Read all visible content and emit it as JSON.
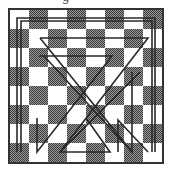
{
  "caption": {
    "visible_text": "g"
  },
  "board": {
    "rows": 8,
    "cols": 8,
    "origin": [
      10,
      10
    ],
    "size": 152,
    "first_square": "light",
    "colors": {
      "light": "#ffffff",
      "dark": "#6e6e6e",
      "border": "#333333",
      "line": "#2a2a2a"
    }
  },
  "tour_lines": [
    [
      [
        21,
        152
      ],
      [
        21,
        21
      ],
      [
        152,
        21
      ],
      [
        152,
        152
      ]
    ],
    [
      [
        17,
        152
      ],
      [
        17,
        18
      ],
      [
        155,
        18
      ],
      [
        155,
        152
      ]
    ],
    [
      [
        40,
        38
      ],
      [
        148,
        38
      ],
      [
        60,
        152
      ],
      [
        110,
        152
      ],
      [
        86,
        118
      ]
    ],
    [
      [
        39,
        56
      ],
      [
        112,
        56
      ],
      [
        37,
        152
      ],
      [
        37,
        118
      ]
    ],
    [
      [
        44,
        56
      ],
      [
        132,
        152
      ],
      [
        132,
        72
      ]
    ],
    [
      [
        118,
        152
      ],
      [
        118,
        120
      ],
      [
        148,
        152
      ]
    ],
    [
      [
        60,
        152
      ],
      [
        140,
        72
      ]
    ],
    [
      [
        40,
        38
      ],
      [
        132,
        152
      ]
    ]
  ]
}
